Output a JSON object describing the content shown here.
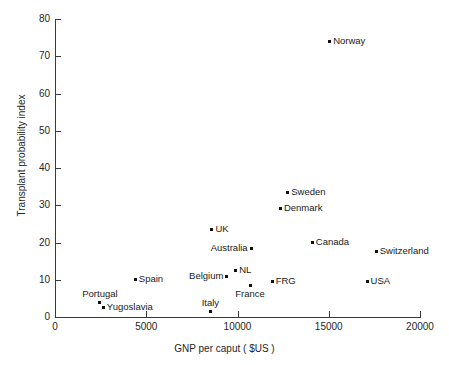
{
  "chart_data": {
    "type": "scatter",
    "title": "",
    "xlabel": "GNP per caput ( $US )",
    "ylabel": "Transplant probability index",
    "xlim": [
      0,
      20000
    ],
    "ylim": [
      0,
      80
    ],
    "xticks": [
      0,
      5000,
      10000,
      15000,
      20000
    ],
    "xticklabels": [
      "0",
      "5000",
      "10000",
      "15000",
      "20000"
    ],
    "yticks": [
      0,
      10,
      20,
      30,
      40,
      50,
      60,
      70,
      80
    ],
    "yticklabels": [
      "0",
      "10",
      "20",
      "30",
      "40",
      "50",
      "60",
      "70",
      "80"
    ],
    "grid": false,
    "legend": null,
    "points": [
      {
        "label": "Norway",
        "x": 15050,
        "y": 74,
        "label_pos": "right"
      },
      {
        "label": "Sweden",
        "x": 12750,
        "y": 33.5,
        "label_pos": "right"
      },
      {
        "label": "Denmark",
        "x": 12350,
        "y": 29,
        "label_pos": "right"
      },
      {
        "label": "UK",
        "x": 8600,
        "y": 23.5,
        "label_pos": "right"
      },
      {
        "label": "Australia",
        "x": 10750,
        "y": 18.5,
        "label_pos": "left"
      },
      {
        "label": "Canada",
        "x": 14100,
        "y": 20,
        "label_pos": "right"
      },
      {
        "label": "Switzerland",
        "x": 17600,
        "y": 17.5,
        "label_pos": "right"
      },
      {
        "label": "NL",
        "x": 9900,
        "y": 12.5,
        "label_pos": "right"
      },
      {
        "label": "Belgium",
        "x": 9400,
        "y": 11,
        "label_pos": "left"
      },
      {
        "label": "Spain",
        "x": 4400,
        "y": 10,
        "label_pos": "right"
      },
      {
        "label": "FRG",
        "x": 11900,
        "y": 9.5,
        "label_pos": "right"
      },
      {
        "label": "USA",
        "x": 17100,
        "y": 9.5,
        "label_pos": "right"
      },
      {
        "label": "France",
        "x": 10700,
        "y": 8.5,
        "label_pos": "below"
      },
      {
        "label": "Portugal",
        "x": 2450,
        "y": 4,
        "label_pos": "above"
      },
      {
        "label": "Yugoslavia",
        "x": 2650,
        "y": 2.5,
        "label_pos": "right"
      },
      {
        "label": "Italy",
        "x": 8500,
        "y": 1.5,
        "label_pos": "above"
      }
    ]
  },
  "figure": {
    "background_color": "#ffffff",
    "axis_color": "#3a3a3a",
    "marker_color": "#111111",
    "text_color": "#1a1a1a"
  }
}
